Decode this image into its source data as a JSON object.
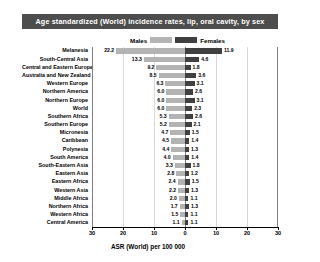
{
  "title": "Age standardized (World) incidence rates, lip, oral cavity, by sex",
  "legend": {
    "male_label": "Males",
    "female_label": "Females",
    "male_color": "#b3b3b3",
    "female_color": "#404040"
  },
  "axis": {
    "title": "ASR (World) per 100 000",
    "ticks": [
      "30",
      "20",
      "10",
      "0",
      "10",
      "20",
      "30"
    ],
    "max": 30
  },
  "chart_data": {
    "type": "bar",
    "title": "Age standardized (World) incidence rates, lip, oral cavity, by sex",
    "xlabel": "ASR (World) per 100 000",
    "ylabel": "",
    "orientation": "horizontal-diverging",
    "xlim": [
      -30,
      30
    ],
    "grid": true,
    "legend_position": "top",
    "categories": [
      "Melanesia",
      "South-Central Asia",
      "Central and Eastern Europe",
      "Australia and New Zealand",
      "Western Europe",
      "Northern America",
      "Northern Europe",
      "World",
      "Southern Africa",
      "Southern Europe",
      "Micronesia",
      "Caribbean",
      "Polynesia",
      "South America",
      "South-Eastern Asia",
      "Eastern Asia",
      "Eastern Africa",
      "Western Asia",
      "Middle Africa",
      "Northern Africa",
      "Western Africa",
      "Central America"
    ],
    "series": [
      {
        "name": "Males",
        "direction": "left",
        "values": [
          22.2,
          13.3,
          9.2,
          8.5,
          6.3,
          6.0,
          6.0,
          6.0,
          5.3,
          5.2,
          4.7,
          4.5,
          4.4,
          4.0,
          3.3,
          2.8,
          2.4,
          2.2,
          2.0,
          1.7,
          1.5,
          1.1
        ]
      },
      {
        "name": "Females",
        "direction": "right",
        "values": [
          11.9,
          4.6,
          1.8,
          3.6,
          3.1,
          2.6,
          3.1,
          2.3,
          2.6,
          2.1,
          1.5,
          1.4,
          1.3,
          1.4,
          1.8,
          1.2,
          1.5,
          1.3,
          1.1,
          1.3,
          1.1,
          1.1
        ]
      }
    ]
  }
}
